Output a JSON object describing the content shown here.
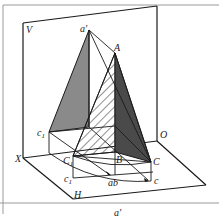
{
  "diagram": {
    "type": "descriptive-geometry",
    "planes": {
      "vertical": "V",
      "horizontal": "H"
    },
    "axis": {
      "start": "X",
      "end": "O"
    },
    "points": {
      "a_prime": "a′",
      "A": "A",
      "c1_prime": "c′₁",
      "X": "X",
      "O": "O",
      "C1": "C₁",
      "B": "B",
      "C": "C",
      "c1": "c₁",
      "ab": "ab",
      "c": "c",
      "H": "H",
      "V": "V"
    },
    "labels": {
      "V": "V",
      "a_prime": "a′",
      "A": "A",
      "c1_prime_main": "c",
      "c1_prime_sub": "1",
      "c1_prime_mark": "′",
      "X": "X",
      "O": "O",
      "C1_main": "C",
      "C1_sub": "1",
      "B": "B",
      "C": "C",
      "c1_main": "c",
      "c1_sub": "1",
      "ab": "ab",
      "c": "c",
      "H": "H",
      "bottom_cut": "a′"
    },
    "colors": {
      "line": "#1a1a1a",
      "shade_light": "#8a8a8a",
      "shade_dark": "#4a4a4a",
      "frame": "#999999"
    }
  }
}
